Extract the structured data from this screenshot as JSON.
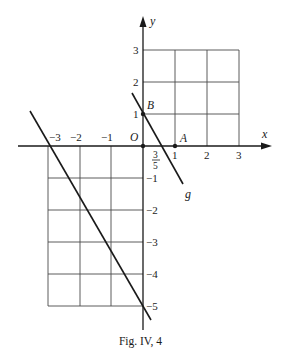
{
  "figure": {
    "caption": "Fig. IV, 4",
    "axis_labels": {
      "x": "x",
      "y": "y"
    },
    "origin_label": "O",
    "points": [
      {
        "name": "A",
        "x": 1,
        "y": 0
      },
      {
        "name": "B",
        "x": 0,
        "y": 1
      },
      {
        "name": "O",
        "x": 0,
        "y": 0
      }
    ],
    "x_ticks_positive": [
      "1",
      "2",
      "3"
    ],
    "x_ticks_negative": [
      "−3",
      "−2",
      "−1"
    ],
    "y_ticks_positive": [
      "1",
      "2",
      "3"
    ],
    "y_ticks_negative": [
      "−1",
      "−2",
      "−3",
      "−4",
      "−5"
    ],
    "special_tick": {
      "numerator": "3",
      "denominator": "5"
    },
    "lines": [
      {
        "name": "g",
        "label": "g",
        "through": [
          [
            0,
            1
          ],
          [
            0.6,
            0
          ]
        ]
      },
      {
        "name": "unlabeled",
        "label": "",
        "through": [
          [
            -3,
            0
          ],
          [
            0,
            -5
          ]
        ]
      }
    ],
    "grids": [
      {
        "quadrant": "I",
        "x_range": [
          0,
          3
        ],
        "y_range": [
          0,
          3
        ]
      },
      {
        "quadrant": "III",
        "x_range": [
          -3,
          0
        ],
        "y_range": [
          -5,
          0
        ]
      }
    ]
  }
}
